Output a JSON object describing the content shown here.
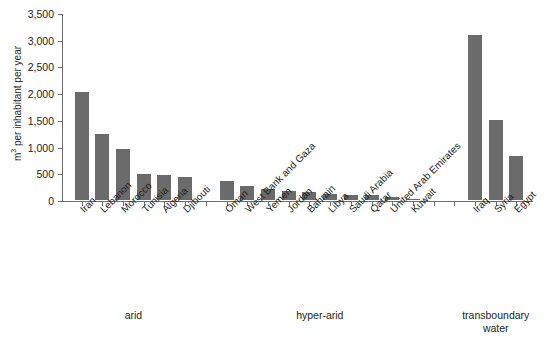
{
  "chart_data": {
    "type": "bar",
    "title": "",
    "subtitle": "",
    "xlabel": "",
    "ylabel": "m3 per inhabitant per year",
    "ylabel_display": "m per inhabitant per year",
    "ylabel_superscript": "3",
    "ylim": [
      0,
      3500
    ],
    "ytick_interval": 500,
    "ytick_labels": [
      "3,500",
      "3,000",
      "2,500",
      "2,000",
      "1,500",
      "1,000",
      "500",
      "0"
    ],
    "ytick_values": [
      3500,
      3000,
      2500,
      2000,
      1500,
      1000,
      500,
      0
    ],
    "grid": false,
    "legend": null,
    "bar_color": "#6b6b6b",
    "axis_color": "#6d6e71",
    "background_color": "#ffffff",
    "categories": [
      "Iran",
      "Lebanon",
      "Morocco",
      "Tunisia",
      "Algeria",
      "Djibouti",
      "Oman",
      "West Bank and Gaza",
      "Yemen",
      "Jordan",
      "Bahrain",
      "Libya",
      "Saudi Arabia",
      "Qatar",
      "United Arab Emirates",
      "Kuwait",
      "Iraq",
      "Syria",
      "Egypt"
    ],
    "values": [
      2020,
      1230,
      960,
      490,
      470,
      440,
      350,
      270,
      210,
      165,
      155,
      110,
      95,
      90,
      55,
      10,
      3080,
      1500,
      820
    ],
    "slots": [
      {
        "index": 0,
        "category": "Iran",
        "value": 2020,
        "group": "arid"
      },
      {
        "index": 1,
        "category": "Lebanon",
        "value": 1230,
        "group": "arid"
      },
      {
        "index": 2,
        "category": "Morocco",
        "value": 960,
        "group": "arid"
      },
      {
        "index": 3,
        "category": "Tunisia",
        "value": 490,
        "group": "arid"
      },
      {
        "index": 4,
        "category": "Algeria",
        "value": 470,
        "group": "arid"
      },
      {
        "index": 5,
        "category": "Djibouti",
        "value": 440,
        "group": "arid"
      },
      {
        "index": 6,
        "category": "",
        "value": null,
        "group": "gap"
      },
      {
        "index": 7,
        "category": "Oman",
        "value": 350,
        "group": "hyper-arid"
      },
      {
        "index": 8,
        "category": "West Bank and Gaza",
        "value": 270,
        "group": "hyper-arid"
      },
      {
        "index": 9,
        "category": "Yemen",
        "value": 210,
        "group": "hyper-arid"
      },
      {
        "index": 10,
        "category": "Jordan",
        "value": 165,
        "group": "hyper-arid"
      },
      {
        "index": 11,
        "category": "Bahrain",
        "value": 155,
        "group": "hyper-arid"
      },
      {
        "index": 12,
        "category": "Libya",
        "value": 110,
        "group": "hyper-arid"
      },
      {
        "index": 13,
        "category": "Saudi Arabia",
        "value": 95,
        "group": "hyper-arid"
      },
      {
        "index": 14,
        "category": "Qatar",
        "value": 90,
        "group": "hyper-arid"
      },
      {
        "index": 15,
        "category": "United Arab Emirates",
        "value": 55,
        "group": "hyper-arid"
      },
      {
        "index": 16,
        "category": "Kuwait",
        "value": 10,
        "group": "hyper-arid"
      },
      {
        "index": 17,
        "category": "",
        "value": null,
        "group": "gap"
      },
      {
        "index": 18,
        "category": "",
        "value": null,
        "group": "gap"
      },
      {
        "index": 19,
        "category": "Iraq",
        "value": 3080,
        "group": "transboundary water"
      },
      {
        "index": 20,
        "category": "Syria",
        "value": 1500,
        "group": "transboundary water"
      },
      {
        "index": 21,
        "category": "Egypt",
        "value": 820,
        "group": "transboundary water"
      }
    ],
    "groups": [
      {
        "label": "arid",
        "line1": "arid",
        "line2": "",
        "center_slot": 2.5
      },
      {
        "label": "hyper-arid",
        "line1": "hyper-arid",
        "line2": "",
        "center_slot": 11.5
      },
      {
        "label": "transboundary water",
        "line1": "transboundary",
        "line2": "water",
        "center_slot": 20.0
      }
    ]
  }
}
